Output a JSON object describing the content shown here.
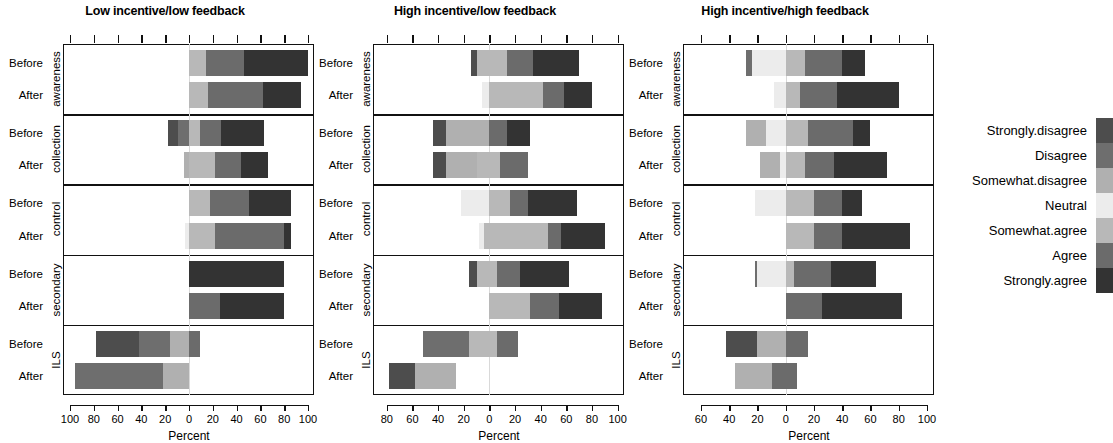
{
  "figure": {
    "axis_title": "Percent",
    "row_labels": [
      "Before",
      "After"
    ],
    "groups": [
      "awareness",
      "collection",
      "control",
      "secondary",
      "ILS"
    ]
  },
  "legend": {
    "title": "",
    "entries": [
      {
        "label": "Strongly.disagree",
        "color": "#4d4d4d"
      },
      {
        "label": "Disagree",
        "color": "#6e6e6e"
      },
      {
        "label": "Somewhat.disagree",
        "color": "#b0b0b0"
      },
      {
        "label": "Neutral",
        "color": "#ececec"
      },
      {
        "label": "Somewhat.agree",
        "color": "#b8b8b8"
      },
      {
        "label": "Agree",
        "color": "#6b6b6b"
      },
      {
        "label": "Strongly.agree",
        "color": "#333333"
      }
    ]
  },
  "chart_data": {
    "type": "bar",
    "subtype": "diverging-stacked-likert",
    "title": "",
    "xlabel": "Percent",
    "ylabel": "",
    "grid": false,
    "legend_position": "right",
    "categories": [
      "Strongly.disagree",
      "Disagree",
      "Somewhat.disagree",
      "Neutral",
      "Somewhat.agree",
      "Agree",
      "Strongly.agree"
    ],
    "colors": [
      "#4d4d4d",
      "#6e6e6e",
      "#b0b0b0",
      "#ececec",
      "#b8b8b8",
      "#6b6b6b",
      "#333333"
    ],
    "groups": [
      "awareness",
      "collection",
      "control",
      "secondary",
      "ILS"
    ],
    "rows": [
      "Before",
      "After"
    ],
    "panels": [
      {
        "title": "Low incentive/low feedback",
        "xlim": [
          -105,
          105
        ],
        "xticks": [
          -100,
          -80,
          -60,
          -40,
          -20,
          0,
          20,
          40,
          60,
          80,
          100
        ],
        "xticklabels": [
          "100",
          "80",
          "60",
          "40",
          "20",
          "0",
          "20",
          "40",
          "60",
          "80",
          "100"
        ],
        "bars": [
          {
            "group": "awareness",
            "row": "Before",
            "values": [
              0,
              0,
              0,
              0,
              14,
              32,
              54
            ],
            "neg_offset": 0
          },
          {
            "group": "awareness",
            "row": "After",
            "values": [
              0,
              0,
              0,
              0,
              16,
              46,
              32
            ],
            "neg_offset": 0
          },
          {
            "group": "collection",
            "row": "Before",
            "values": [
              9,
              9,
              0,
              0,
              9,
              18,
              36
            ],
            "neg_offset": -18
          },
          {
            "group": "collection",
            "row": "After",
            "values": [
              0,
              0,
              4,
              0,
              22,
              22,
              22
            ],
            "neg_offset": -4
          },
          {
            "group": "control",
            "row": "Before",
            "values": [
              0,
              0,
              0,
              0,
              18,
              32,
              36
            ],
            "neg_offset": 0
          },
          {
            "group": "control",
            "row": "After",
            "values": [
              0,
              0,
              0,
              3,
              22,
              58,
              6
            ],
            "neg_offset": -3
          },
          {
            "group": "secondary",
            "row": "Before",
            "values": [
              0,
              0,
              0,
              0,
              0,
              0,
              80
            ],
            "neg_offset": 0
          },
          {
            "group": "secondary",
            "row": "After",
            "values": [
              0,
              0,
              0,
              0,
              0,
              26,
              54
            ],
            "neg_offset": 0
          },
          {
            "group": "ILS",
            "row": "Before",
            "values": [
              36,
              26,
              16,
              0,
              0,
              9,
              0
            ],
            "neg_offset": -78
          },
          {
            "group": "ILS",
            "row": "After",
            "values": [
              0,
              74,
              22,
              0,
              0,
              0,
              0
            ],
            "neg_offset": -96
          }
        ]
      },
      {
        "title": "High incentive/low feedback",
        "xlim": [
          -90,
          105
        ],
        "xticks": [
          -80,
          -60,
          -40,
          -20,
          0,
          20,
          40,
          60,
          80,
          100
        ],
        "xticklabels": [
          "80",
          "60",
          "40",
          "20",
          "0",
          "20",
          "40",
          "60",
          "80",
          "100"
        ],
        "bars": [
          {
            "group": "awareness",
            "row": "Before",
            "values": [
              4,
              0,
              0,
              0,
              24,
              20,
              36
            ],
            "neg_offset": -14
          },
          {
            "group": "awareness",
            "row": "After",
            "values": [
              0,
              0,
              0,
              6,
              42,
              16,
              22
            ],
            "neg_offset": -6
          },
          {
            "group": "collection",
            "row": "Before",
            "values": [
              10,
              0,
              34,
              0,
              0,
              14,
              18
            ],
            "neg_offset": -44
          },
          {
            "group": "collection",
            "row": "After",
            "values": [
              10,
              0,
              24,
              0,
              18,
              22,
              0
            ],
            "neg_offset": -44
          },
          {
            "group": "control",
            "row": "Before",
            "values": [
              0,
              0,
              0,
              22,
              16,
              14,
              38
            ],
            "neg_offset": -22
          },
          {
            "group": "control",
            "row": "After",
            "values": [
              0,
              0,
              0,
              4,
              50,
              10,
              34
            ],
            "neg_offset": -8
          },
          {
            "group": "secondary",
            "row": "Before",
            "values": [
              6,
              0,
              0,
              0,
              16,
              18,
              38
            ],
            "neg_offset": -16
          },
          {
            "group": "secondary",
            "row": "After",
            "values": [
              0,
              0,
              0,
              0,
              32,
              22,
              34
            ],
            "neg_offset": 0
          },
          {
            "group": "ILS",
            "row": "Before",
            "values": [
              0,
              36,
              0,
              0,
              22,
              16,
              0
            ],
            "neg_offset": -52
          },
          {
            "group": "ILS",
            "row": "After",
            "values": [
              20,
              0,
              32,
              0,
              0,
              0,
              0
            ],
            "neg_offset": -78
          }
        ]
      },
      {
        "title": "High incentive/high feedback",
        "xlim": [
          -72,
          105
        ],
        "xticks": [
          -60,
          -40,
          -20,
          0,
          20,
          40,
          60,
          80,
          100
        ],
        "xticklabels": [
          "60",
          "40",
          "20",
          "0",
          "20",
          "40",
          "60",
          "80",
          "100"
        ],
        "bars": [
          {
            "group": "awareness",
            "row": "Before",
            "values": [
              0,
              4,
              0,
              24,
              14,
              26,
              16
            ],
            "neg_offset": -28
          },
          {
            "group": "awareness",
            "row": "After",
            "values": [
              0,
              0,
              0,
              8,
              10,
              26,
              44
            ],
            "neg_offset": -8
          },
          {
            "group": "collection",
            "row": "Before",
            "values": [
              0,
              0,
              14,
              14,
              16,
              32,
              12
            ],
            "neg_offset": -28
          },
          {
            "group": "collection",
            "row": "After",
            "values": [
              0,
              0,
              14,
              4,
              14,
              20,
              38
            ],
            "neg_offset": -18
          },
          {
            "group": "control",
            "row": "Before",
            "values": [
              0,
              0,
              0,
              22,
              20,
              20,
              14
            ],
            "neg_offset": -22
          },
          {
            "group": "control",
            "row": "After",
            "values": [
              0,
              0,
              0,
              0,
              20,
              20,
              48
            ],
            "neg_offset": 0
          },
          {
            "group": "secondary",
            "row": "Before",
            "values": [
              0,
              2,
              0,
              20,
              6,
              26,
              32
            ],
            "neg_offset": -22
          },
          {
            "group": "secondary",
            "row": "After",
            "values": [
              0,
              0,
              0,
              0,
              0,
              26,
              56
            ],
            "neg_offset": 0
          },
          {
            "group": "ILS",
            "row": "Before",
            "values": [
              22,
              0,
              20,
              0,
              0,
              16,
              0
            ],
            "neg_offset": -42
          },
          {
            "group": "ILS",
            "row": "After",
            "values": [
              0,
              0,
              26,
              0,
              0,
              18,
              0
            ],
            "neg_offset": -36
          }
        ]
      }
    ]
  }
}
